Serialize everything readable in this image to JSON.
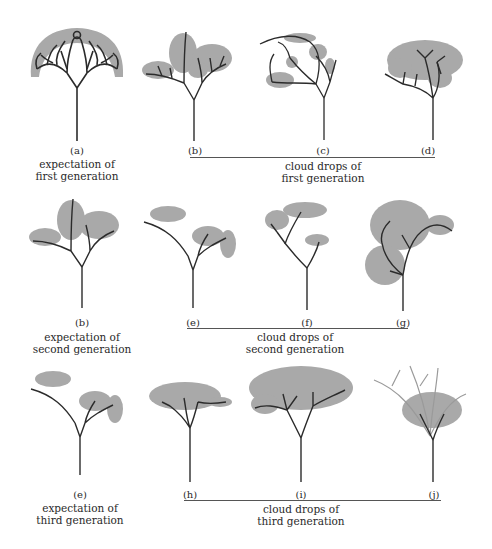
{
  "figure": {
    "rows": [
      {
        "id": "first",
        "expectation": {
          "label": "(a)",
          "caption_line1": "expectation of",
          "caption_line2": "first generation"
        },
        "drops": [
          {
            "label": "(b)"
          },
          {
            "label": "(c)"
          },
          {
            "label": "(d)"
          }
        ],
        "group_caption_line1": "cloud drops of",
        "group_caption_line2": "first generation"
      },
      {
        "id": "second",
        "expectation": {
          "label": "(b)",
          "caption_line1": "expectation of",
          "caption_line2": "second generation"
        },
        "drops": [
          {
            "label": "(e)"
          },
          {
            "label": "(f)"
          },
          {
            "label": "(g)"
          }
        ],
        "group_caption_line1": "cloud drops of",
        "group_caption_line2": "second generation"
      },
      {
        "id": "third",
        "expectation": {
          "label": "(e)",
          "caption_line1": "expectation of",
          "caption_line2": "third generation"
        },
        "drops": [
          {
            "label": "(h)"
          },
          {
            "label": "(i)"
          },
          {
            "label": "(j)"
          }
        ],
        "group_caption_line1": "cloud drops of",
        "group_caption_line2": "third generation"
      }
    ],
    "colors": {
      "branch": "#2b2b2b",
      "foliage": "#a9a9a9",
      "rule": "#555555"
    }
  }
}
